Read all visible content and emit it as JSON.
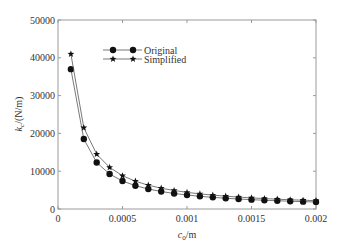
{
  "chart_data": {
    "type": "line",
    "title": "",
    "xlabel": "c0/m",
    "xlabel_main": "c",
    "xlabel_sub": "0",
    "xlabel_unit": "/m",
    "ylabel": "kc/(N/m)",
    "ylabel_main": "k",
    "ylabel_sub": "c",
    "ylabel_unit": "/(N/m)",
    "xlim": [
      0,
      0.002
    ],
    "ylim": [
      0,
      50000
    ],
    "grid": false,
    "legend_position": "upper center",
    "x_ticks": [
      "0",
      "0.0005",
      "0.001",
      "0.0015",
      "0.002"
    ],
    "x_tick_values": [
      0,
      0.0005,
      0.001,
      0.0015,
      0.002
    ],
    "y_ticks": [
      "0",
      "10000",
      "20000",
      "30000",
      "40000",
      "50000"
    ],
    "y_tick_values": [
      0,
      10000,
      20000,
      30000,
      40000,
      50000
    ],
    "x": [
      0.0001,
      0.0002,
      0.0003,
      0.0004,
      0.0005,
      0.0006,
      0.0007,
      0.0008,
      0.0009,
      0.001,
      0.0011,
      0.0012,
      0.0013,
      0.0014,
      0.0015,
      0.0016,
      0.0017,
      0.0018,
      0.0019,
      0.002
    ],
    "series": [
      {
        "name": "Original",
        "marker": "circle",
        "values": [
          37000,
          18500,
          12300,
          9250,
          7400,
          6170,
          5290,
          4630,
          4110,
          3700,
          3360,
          3080,
          2850,
          2640,
          2470,
          2310,
          2180,
          2060,
          1950,
          1850
        ]
      },
      {
        "name": "Simplified",
        "marker": "star",
        "values": [
          41000,
          21500,
          14500,
          11000,
          8800,
          7350,
          6300,
          5500,
          4900,
          4400,
          4000,
          3670,
          3390,
          3150,
          2940,
          2750,
          2590,
          2450,
          2320,
          2200
        ]
      }
    ]
  },
  "legend": {
    "items": [
      {
        "label": "Original"
      },
      {
        "label": "Simplified"
      }
    ]
  },
  "colors": {
    "axis": "#9a9a9a",
    "line": "#555555",
    "marker": "#111111",
    "text": "#333333"
  }
}
